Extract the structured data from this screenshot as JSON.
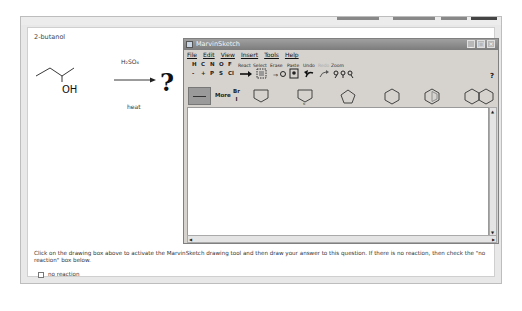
{
  "question": {
    "title": "2-butanol",
    "reagent_top": "H₂SO₄",
    "reagent_bottom": "heat",
    "product": "?",
    "substituent_label": "OH"
  },
  "marvin": {
    "title": "MarvinSketch",
    "window_buttons": [
      "minimize",
      "maximize",
      "close"
    ],
    "menu": [
      "File",
      "Edit",
      "View",
      "Insert",
      "Tools",
      "Help"
    ],
    "atoms_row1": [
      "H",
      "C",
      "N",
      "O",
      "F"
    ],
    "atoms_row2": [
      "-",
      "+",
      "P",
      "S",
      "Cl"
    ],
    "tool_labels": [
      "React",
      "Select",
      "Erase",
      "Paste",
      "Undo",
      "Redo",
      "Zoom"
    ],
    "more_label": "More",
    "br_label": "Br",
    "i_label": "I",
    "help_label": "?",
    "templates": [
      "cyclohexane-chair-template",
      "ring-n-template",
      "cyclopentane",
      "cyclohexane",
      "benzene",
      "naphthalene"
    ]
  },
  "instructions": "Click on the drawing box above to activate the MarvinSketch drawing tool and then draw your answer to this question. If there is no reaction, then check the \"no reaction\" box below.",
  "no_reaction": {
    "label": "no reaction",
    "checked": false
  }
}
